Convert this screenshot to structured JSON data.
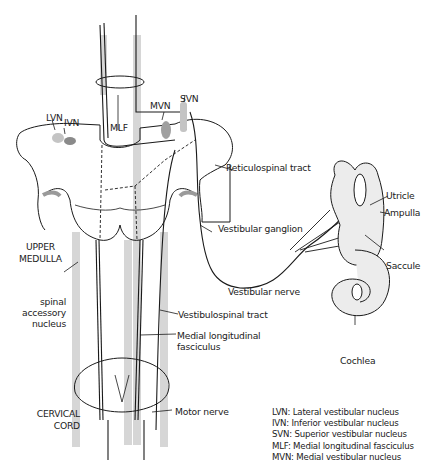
{
  "diagram": {
    "labels": {
      "lvn": "LVN",
      "ivn": "IVN",
      "mlf": "MLF",
      "mvn": "MVN",
      "svn": "SVN",
      "reticulospinal": "Reticulospinal tract",
      "vestibular_ganglion": "Vestibular ganglion",
      "utricle": "Utricle",
      "ampulla": "Ampulla",
      "saccule": "Saccule",
      "upper_medulla_1": "UPPER",
      "upper_medulla_2": "MEDULLA",
      "vestibular_nerve": "Vestibular nerve",
      "spinal_1": "spinal",
      "spinal_2": "accessory",
      "spinal_3": "nucleus",
      "vestibulospinal": "Vestibulospinal tract",
      "mlf_long_1": "Medial longitudinal",
      "mlf_long_2": "fasciculus",
      "cochlea": "Cochlea",
      "cervical_1": "CERVICAL",
      "cervical_2": "CORD",
      "motor_nerve": "Motor nerve"
    },
    "legend": [
      "LVN: Lateral vestibular nucleus",
      "IVN: Inferior vestibular nucleus",
      "SVN: Superior vestibular nucleus",
      "MLF: Medial longitudinal fasciculus",
      "MVN: Medial vestibular nucleus"
    ],
    "colors": {
      "line": "#1a1a1a",
      "tract_gray": "#cfcfcf",
      "nucleus_gray": "#9a9a9a",
      "fill_light": "#ececec"
    }
  }
}
